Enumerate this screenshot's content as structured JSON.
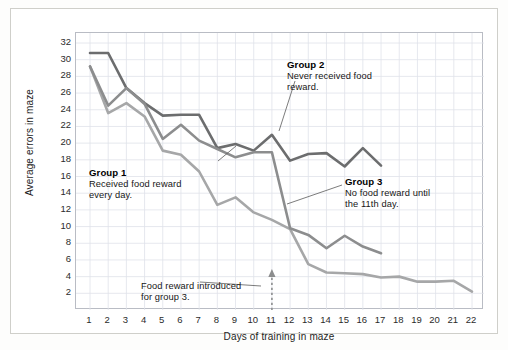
{
  "axes": {
    "x_title": "Days of training in maze",
    "y_title": "Average errors in maze",
    "x_ticks": [
      1,
      2,
      3,
      4,
      5,
      6,
      7,
      8,
      9,
      10,
      11,
      12,
      13,
      14,
      15,
      16,
      17,
      18,
      19,
      20,
      21,
      22
    ],
    "y_ticks": [
      2,
      4,
      6,
      8,
      10,
      12,
      14,
      16,
      18,
      20,
      22,
      24,
      26,
      28,
      30,
      32
    ]
  },
  "annotations": {
    "group1": {
      "title": "Group 1",
      "body": "Received food reward\nevery day."
    },
    "group2": {
      "title": "Group 2",
      "body": "Never received food\nreward."
    },
    "group3": {
      "title": "Group 3",
      "body": "No food reward until\nthe 11th day."
    },
    "intro": {
      "body": "Food reward introduced\nfor group 3."
    }
  },
  "colors": {
    "group1": "#a6a7a8",
    "group2": "#6c6d6e",
    "group3": "#8c8d8e",
    "grid": "#dfe2ea",
    "frame": "#b9bcc4",
    "leader": "#5a5a5a"
  },
  "chart_data": {
    "type": "line",
    "title": "",
    "xlabel": "Days of training in maze",
    "ylabel": "Average errors in maze",
    "xlim": [
      1,
      22
    ],
    "ylim": [
      0,
      32
    ],
    "grid": true,
    "legend": "annotated-inline",
    "x": [
      1,
      2,
      3,
      4,
      5,
      6,
      7,
      8,
      9,
      10,
      11,
      12,
      13,
      14,
      15,
      16,
      17,
      18,
      19,
      20,
      21,
      22
    ],
    "series": [
      {
        "name": "Group 1",
        "description": "Received food reward every day.",
        "color": "#a6a7a8",
        "x": [
          1,
          2,
          3,
          4,
          5,
          6,
          7,
          8,
          9,
          10,
          11,
          12,
          13,
          14,
          15,
          16,
          17,
          18,
          19,
          20,
          21,
          22
        ],
        "values": [
          29.2,
          23.6,
          24.8,
          23.2,
          19.1,
          18.6,
          16.6,
          12.6,
          13.5,
          11.7,
          10.8,
          9.7,
          5.5,
          4.5,
          4.4,
          4.3,
          3.9,
          4.0,
          3.4,
          3.4,
          3.5,
          2.2
        ]
      },
      {
        "name": "Group 2",
        "description": "Never received food reward.",
        "color": "#6c6d6e",
        "x": [
          1,
          2,
          3,
          4,
          5,
          6,
          7,
          8,
          9,
          10,
          11,
          12,
          13,
          14,
          15,
          16,
          17
        ],
        "values": [
          30.8,
          30.8,
          26.6,
          24.8,
          23.3,
          23.4,
          23.4,
          19.4,
          19.9,
          19.1,
          21.0,
          17.9,
          18.7,
          18.8,
          17.2,
          19.4,
          17.3
        ]
      },
      {
        "name": "Group 3",
        "description": "No food reward until the 11th day.",
        "color": "#8c8d8e",
        "x": [
          1,
          2,
          3,
          4,
          5,
          6,
          7,
          8,
          9,
          10,
          11,
          12,
          13,
          14,
          15,
          16,
          17
        ],
        "values": [
          29.2,
          24.5,
          26.6,
          24.7,
          20.5,
          22.2,
          20.3,
          19.3,
          18.3,
          18.9,
          18.9,
          9.8,
          9.0,
          7.4,
          8.9,
          7.6,
          6.8
        ]
      }
    ],
    "markers": [
      {
        "name": "food-reward-introduced",
        "type": "vertical-arrow",
        "x": 11,
        "label": "Food reward introduced for group 3."
      }
    ]
  }
}
